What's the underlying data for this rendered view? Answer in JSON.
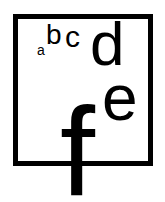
{
  "figure": {
    "title": "",
    "background_color": "#ffffff",
    "ink_color": "#000000",
    "frame": {
      "shape": "square",
      "stroke_color": "#000000",
      "stroke_width": 5,
      "fill": "none"
    },
    "glyphs": [
      {
        "label": "a",
        "size_rank": 1,
        "font_size_px": 14
      },
      {
        "label": "b",
        "size_rank": 2,
        "font_size_px": 28
      },
      {
        "label": "c",
        "size_rank": 3,
        "font_size_px": 30
      },
      {
        "label": "d",
        "size_rank": 4,
        "font_size_px": 62
      },
      {
        "label": "e",
        "size_rank": 5,
        "font_size_px": 64
      },
      {
        "label": "f",
        "size_rank": 6,
        "font_size_px": 126
      }
    ]
  }
}
